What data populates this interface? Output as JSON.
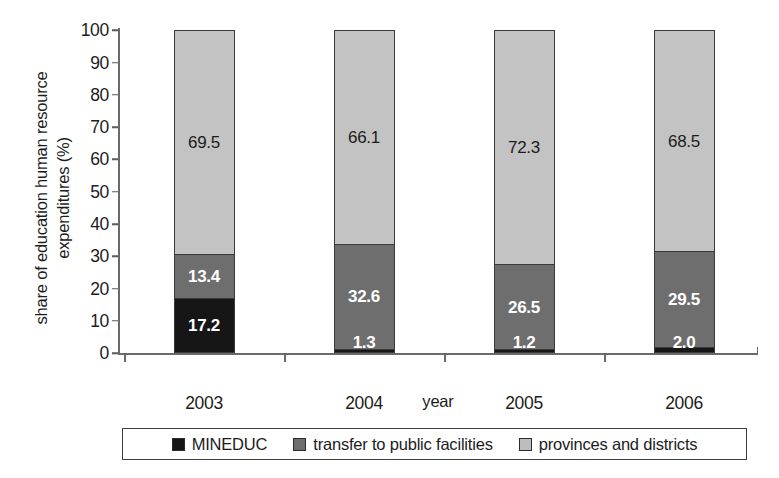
{
  "chart_data": {
    "type": "bar",
    "subtype": "stacked-bar",
    "title": "",
    "xlabel": "year",
    "ylabel": "share of education human resource expenditures (%)",
    "ylabel_line1": "share of education human resource",
    "ylabel_line2": "expenditures (%)",
    "categories": [
      "2003",
      "2004",
      "2005",
      "2006"
    ],
    "ylim": [
      0,
      100
    ],
    "yticks": [
      0,
      10,
      20,
      30,
      40,
      50,
      60,
      70,
      80,
      90,
      100
    ],
    "ytick_labels": [
      "0",
      "10",
      "20",
      "30",
      "40",
      "50",
      "60",
      "70",
      "80",
      "90",
      "100"
    ],
    "grid": false,
    "legend_position": "bottom",
    "series": [
      {
        "name": "MINEDUC",
        "color": "#161616",
        "label_color": "#ffffff",
        "values": [
          17.2,
          1.3,
          1.2,
          2.0
        ],
        "labels": [
          "17.2",
          "1.3",
          "1.2",
          "2.0"
        ]
      },
      {
        "name": "transfer to public facilities",
        "color": "#6e6e6e",
        "label_color": "#ffffff",
        "values": [
          13.4,
          32.6,
          26.5,
          29.5
        ],
        "labels": [
          "13.4",
          "32.6",
          "26.5",
          "29.5"
        ]
      },
      {
        "name": "provinces and districts",
        "color": "#c3c3c3",
        "label_color": "#1c1c1c",
        "values": [
          69.5,
          66.1,
          72.3,
          68.5
        ],
        "labels": [
          "69.5",
          "66.1",
          "72.3",
          "68.5"
        ]
      }
    ]
  },
  "legend": {
    "items": [
      {
        "label": "MINEDUC",
        "swatch": "mineduc"
      },
      {
        "label": "transfer to public facilities",
        "swatch": "transfer"
      },
      {
        "label": "provinces and districts",
        "swatch": "provinces"
      }
    ]
  }
}
